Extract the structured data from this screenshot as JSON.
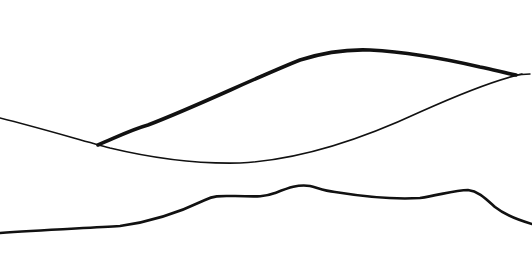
{
  "drawing": {
    "title": "",
    "subject": "line sketch of a lens-shaped form above a wavy horizon",
    "background_color": "#ffffff",
    "ink_color": "#111111",
    "strokes": [
      {
        "name": "upper-arc",
        "description": "thick curved upper contour"
      },
      {
        "name": "lower-curve",
        "description": "thin sagging curve from left edge to right tip"
      },
      {
        "name": "horizon-line",
        "description": "wavy ground/horizon line"
      }
    ]
  }
}
